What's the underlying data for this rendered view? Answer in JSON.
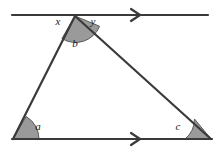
{
  "figure": {
    "type": "geometry-diagram",
    "background_color": "#ffffff",
    "stroke_color": "#3a3a3a",
    "angle_fill_color": "#9a9a9a",
    "angle_stroke_color": "#5a5a5a",
    "label_color": "#1a1a1a"
  },
  "labels": {
    "x": "x",
    "y": "y",
    "b": "b",
    "a": "a",
    "c": "c"
  },
  "label_positions": {
    "x": {
      "x": 58,
      "y": 25
    },
    "y": {
      "x": 93,
      "y": 25
    },
    "b": {
      "x": 75,
      "y": 47
    },
    "a": {
      "x": 38,
      "y": 130
    },
    "c": {
      "x": 178,
      "y": 130
    }
  },
  "points": {
    "apex": {
      "x": 75,
      "y": 16
    },
    "bottom_left": {
      "x": 13,
      "y": 139
    },
    "bottom_right": {
      "x": 211,
      "y": 139
    }
  },
  "lines": {
    "top_parallel": {
      "name": "top parallel line through apex",
      "x1": 12,
      "y1": 15,
      "x2": 208,
      "y2": 15,
      "arrow_marks": 1,
      "arrow_x": 137
    },
    "bottom_base": {
      "name": "base of triangle",
      "x1": 12,
      "y1": 139,
      "x2": 212,
      "y2": 139,
      "arrow_marks": 1,
      "arrow_x": 137
    },
    "left_side": {
      "x1": 75,
      "y1": 16,
      "x2": 13,
      "y2": 139
    },
    "right_side": {
      "x1": 75,
      "y1": 16,
      "x2": 211,
      "y2": 139
    }
  },
  "angle_arcs": [
    {
      "name": "angle-b-apex",
      "vertex": "apex",
      "radius": 26,
      "shaded": true
    },
    {
      "name": "angle-a-bottom-left",
      "vertex": "bottom_left",
      "radius": 26,
      "shaded": true
    },
    {
      "name": "angle-c-bottom-right",
      "vertex": "bottom_right",
      "radius": 26,
      "shaded": true
    }
  ]
}
